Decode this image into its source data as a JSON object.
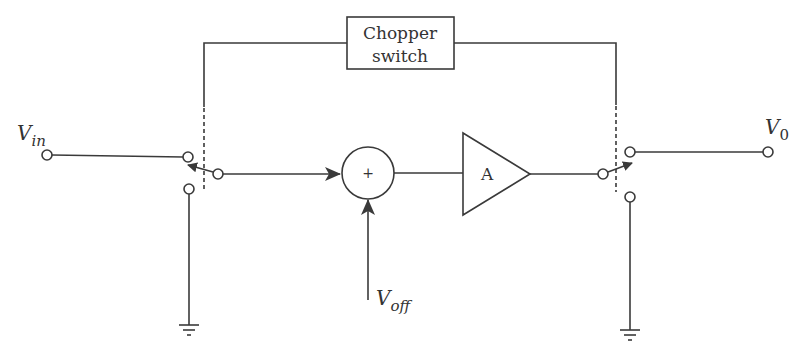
{
  "diagram": {
    "chopper_box": {
      "line1": "Chopper",
      "line2": "switch"
    },
    "input_label": {
      "main": "V",
      "sub": "in"
    },
    "output_label": {
      "main": "V",
      "sub": "0"
    },
    "offset_label": {
      "main": "V",
      "sub": "off"
    },
    "summer_symbol": "+",
    "amplifier_label": "A",
    "colors": {
      "line": "#3a3a3a",
      "text": "#333333",
      "background": "#ffffff"
    }
  }
}
